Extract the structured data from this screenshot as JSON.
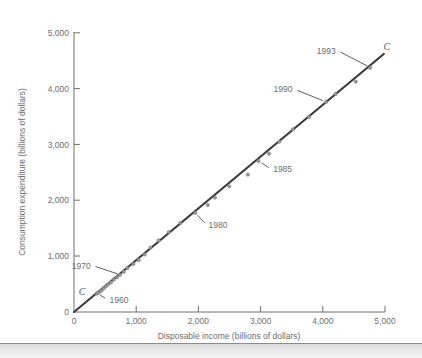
{
  "figure": {
    "background_color": "#ffffff",
    "line_color": "#3c3c3c",
    "dot_color": "#9a9a9a",
    "text_color": "#6e6e6e",
    "axis_color": "#6e6e6e",
    "band_color": "#e6e6e6"
  },
  "chart_data": {
    "type": "scatter",
    "title": "",
    "subtitle": "",
    "xlabel": "Disposable income (billions of dollars)",
    "ylabel": "Consumption expenditure (billions of dollars)",
    "xlim": [
      0,
      5000
    ],
    "ylim": [
      0,
      5000
    ],
    "xticks": [
      0,
      1000,
      2000,
      3000,
      4000,
      5000
    ],
    "yticks": [
      0,
      1000,
      2000,
      3000,
      4000,
      5000
    ],
    "xtick_labels": [
      "0",
      "1,000",
      "2,000",
      "3,000",
      "4,000",
      "5,000"
    ],
    "ytick_labels": [
      "0",
      "1,000",
      "2,000",
      "3,000",
      "4,000",
      "5,000"
    ],
    "grid": false,
    "legend": "none",
    "series": [
      {
        "name": "Consumption function C",
        "type": "scatter",
        "marker": "circle",
        "color": "#9a9a9a",
        "points": [
          {
            "year": 1960,
            "x": 365,
            "y": 332
          },
          {
            "year": 1961,
            "x": 385,
            "y": 343
          },
          {
            "year": 1962,
            "x": 415,
            "y": 365
          },
          {
            "year": 1963,
            "x": 440,
            "y": 385
          },
          {
            "year": 1964,
            "x": 475,
            "y": 420
          },
          {
            "year": 1965,
            "x": 515,
            "y": 460
          },
          {
            "year": 1966,
            "x": 555,
            "y": 500
          },
          {
            "year": 1967,
            "x": 595,
            "y": 530
          },
          {
            "year": 1968,
            "x": 640,
            "y": 580
          },
          {
            "year": 1969,
            "x": 690,
            "y": 620
          },
          {
            "year": 1970,
            "x": 740,
            "y": 665
          },
          {
            "year": 1971,
            "x": 800,
            "y": 720
          },
          {
            "year": 1972,
            "x": 860,
            "y": 790
          },
          {
            "year": 1973,
            "x": 955,
            "y": 860
          },
          {
            "year": 1974,
            "x": 1040,
            "y": 930
          },
          {
            "year": 1975,
            "x": 1135,
            "y": 1030
          },
          {
            "year": 1976,
            "x": 1230,
            "y": 1150
          },
          {
            "year": 1977,
            "x": 1360,
            "y": 1280
          },
          {
            "year": 1978,
            "x": 1525,
            "y": 1430
          },
          {
            "year": 1979,
            "x": 1710,
            "y": 1595
          },
          {
            "year": 1980,
            "x": 1950,
            "y": 1775
          },
          {
            "year": 1981,
            "x": 2150,
            "y": 1915
          },
          {
            "year": 1982,
            "x": 2265,
            "y": 2050
          },
          {
            "year": 1983,
            "x": 2495,
            "y": 2250
          },
          {
            "year": 1984,
            "x": 2795,
            "y": 2460
          },
          {
            "year": 1985,
            "x": 2965,
            "y": 2705
          },
          {
            "year": 1986,
            "x": 3135,
            "y": 2835
          },
          {
            "year": 1987,
            "x": 3300,
            "y": 3050
          },
          {
            "year": 1988,
            "x": 3520,
            "y": 3270
          },
          {
            "year": 1989,
            "x": 3780,
            "y": 3495
          },
          {
            "year": 1990,
            "x": 4050,
            "y": 3760
          },
          {
            "year": 1991,
            "x": 4205,
            "y": 3905
          },
          {
            "year": 1992,
            "x": 4530,
            "y": 4125
          },
          {
            "year": 1993,
            "x": 4760,
            "y": 4375
          }
        ]
      }
    ],
    "fit_line": {
      "name": "C",
      "color": "#3c3c3c",
      "from": {
        "x": 0,
        "y": 0
      },
      "to": {
        "x": 4980,
        "y": 4620
      }
    },
    "annotations": [
      {
        "label": "1960",
        "label_x": 540,
        "label_y": 215,
        "point_x": 375,
        "point_y": 340
      },
      {
        "label": "1970",
        "label_x": 300,
        "label_y": 830,
        "point_x": 745,
        "point_y": 668
      },
      {
        "label": "1980",
        "label_x": 2130,
        "label_y": 1560,
        "point_x": 1955,
        "point_y": 1770
      },
      {
        "label": "1985",
        "label_x": 3170,
        "label_y": 2555,
        "point_x": 2975,
        "point_y": 2700
      },
      {
        "label": "1990",
        "label_x": 3545,
        "label_y": 3990,
        "point_x": 4045,
        "point_y": 3765
      },
      {
        "label": "1993",
        "label_x": 4240,
        "label_y": 4680,
        "point_x": 4760,
        "point_y": 4380
      }
    ],
    "curve_labels": [
      {
        "text": "C",
        "x": 130,
        "y": 365,
        "position": "lower-left"
      },
      {
        "text": "C",
        "x": 5030,
        "y": 4740,
        "position": "upper-right"
      }
    ]
  }
}
